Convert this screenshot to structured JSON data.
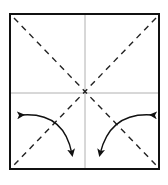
{
  "diagram": {
    "type": "origami-fold-diagram",
    "square": {
      "x": 10,
      "y": 14,
      "width": 149,
      "height": 155,
      "stroke": "#111111",
      "stroke_width": 2
    },
    "creases": {
      "center_color": "#b0b0b0",
      "diagonal_color": "#222222",
      "diagonal_dash": "6 5"
    },
    "arrows": [
      {
        "id": "left-fold-arrow",
        "from": "left-edge",
        "to": "bottom",
        "double_headed": true
      },
      {
        "id": "right-fold-arrow",
        "from": "right-edge",
        "to": "bottom",
        "double_headed": true
      }
    ],
    "colors": {
      "background": "#ffffff",
      "ink": "#111111"
    }
  }
}
